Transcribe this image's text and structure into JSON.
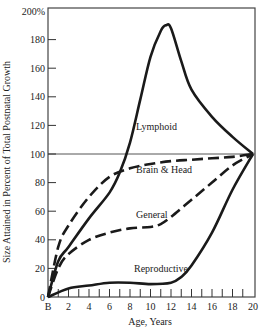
{
  "chart_data": {
    "type": "line",
    "title": "",
    "xlabel": "Age, Years",
    "ylabel": "Size Attained in Percent of Total Postnatal Growth",
    "xlim": [
      0,
      20
    ],
    "ylim": [
      0,
      200
    ],
    "x_tick_labels": [
      "B",
      "2",
      "4",
      "6",
      "8",
      "10",
      "12",
      "14",
      "16",
      "18",
      "20"
    ],
    "y_tick_labels": [
      "0",
      "20",
      "40",
      "60",
      "80",
      "100",
      "120",
      "140",
      "160",
      "180",
      "200%"
    ],
    "reference_line": {
      "y": 100
    },
    "grid": false,
    "legend": "inline labels",
    "series": [
      {
        "name": "Lymphoid",
        "style": "solid",
        "x": [
          0,
          1,
          2,
          4,
          6,
          7,
          8,
          9,
          10,
          11,
          11.5,
          12,
          13,
          14,
          16,
          18,
          20
        ],
        "values": [
          0,
          25,
          35,
          55,
          73,
          87,
          108,
          138,
          168,
          186,
          190,
          188,
          165,
          145,
          126,
          112,
          100
        ]
      },
      {
        "name": "Brain & Head",
        "style": "dashed",
        "x": [
          0,
          1,
          2,
          4,
          6,
          8,
          10,
          12,
          14,
          16,
          18,
          20
        ],
        "values": [
          0,
          35,
          50,
          70,
          84,
          90,
          93,
          95,
          96,
          97,
          98,
          100
        ]
      },
      {
        "name": "General",
        "style": "dashed",
        "x": [
          0,
          1,
          2,
          4,
          6,
          8,
          10,
          11,
          12,
          14,
          16,
          18,
          20
        ],
        "values": [
          0,
          20,
          30,
          40,
          45,
          48,
          49,
          51,
          56,
          68,
          80,
          92,
          100
        ]
      },
      {
        "name": "Reproductive",
        "style": "solid",
        "x": [
          0,
          2,
          4,
          6,
          8,
          10,
          12,
          13,
          14,
          16,
          18,
          20
        ],
        "values": [
          0,
          6,
          8,
          10,
          10,
          9,
          10,
          14,
          22,
          45,
          75,
          100
        ]
      }
    ]
  },
  "labels": {
    "lymphoid": "Lymphoid",
    "brain": "Brain & Head",
    "general": "General",
    "reproductive": "Reproductive",
    "xlabel": "Age, Years",
    "ylabel": "Size Attained in Percent of Total Postnatal Growth"
  }
}
